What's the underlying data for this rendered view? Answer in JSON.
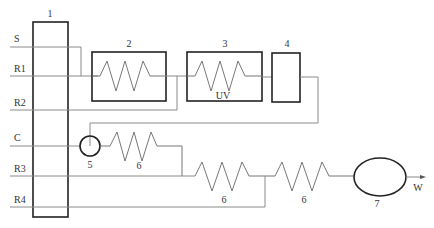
{
  "diagram": {
    "title": "",
    "streams": {
      "S": "S",
      "R1": "R1",
      "R2": "R2",
      "C": "C",
      "R3": "R3",
      "R4": "R4",
      "W": "W"
    },
    "units": {
      "u1": "1",
      "u2": "2",
      "u3": "3",
      "u3_note": "UV",
      "u4": "4",
      "u5": "5",
      "u6a": "6",
      "u6b": "6",
      "u6c": "6",
      "u7": "7"
    }
  }
}
